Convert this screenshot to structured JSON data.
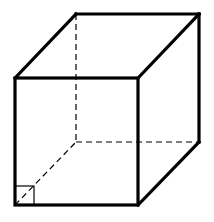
{
  "figure": {
    "type": "cube",
    "colors": {
      "stroke": "#000000",
      "background": "#ffffff"
    },
    "vertices": {
      "front_top_left": [
        15,
        78
      ],
      "front_top_right": [
        138,
        78
      ],
      "front_bottom_left": [
        15,
        205
      ],
      "front_bottom_right": [
        138,
        205
      ],
      "back_top_left": [
        76,
        14
      ],
      "back_top_right": [
        199,
        14
      ],
      "back_bottom_left": [
        76,
        142
      ],
      "back_bottom_right": [
        199,
        142
      ]
    },
    "visible_edges": 9,
    "hidden_edges": 3,
    "right_angle_marker": {
      "x": 15,
      "y": 186,
      "size": 19
    }
  }
}
